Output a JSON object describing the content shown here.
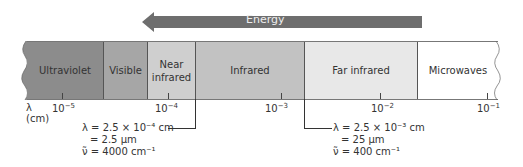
{
  "energy_arrow": {
    "label": "Energy",
    "direction": "left",
    "color": "#6e6e6e"
  },
  "axis": {
    "symbol": "λ",
    "unit": "(cm)",
    "ticks": [
      {
        "base": "10",
        "exp": "−5",
        "x": 62
      },
      {
        "base": "10",
        "exp": "−4",
        "x": 162
      },
      {
        "base": "10",
        "exp": "−3",
        "x": 272
      },
      {
        "base": "10",
        "exp": "−2",
        "x": 381
      },
      {
        "base": "10",
        "exp": "−1",
        "x": 487
      }
    ]
  },
  "regions": [
    {
      "label": "Ultraviolet",
      "color": "#8c8c8c"
    },
    {
      "label": "Visible",
      "color": "#a6a6a6"
    },
    {
      "label": "Near\ninfrared",
      "color": "#cfcfcf"
    },
    {
      "label": "Infrared",
      "color": "#c2c2c2"
    },
    {
      "label": "Far infrared",
      "color": "#e8e8e8"
    },
    {
      "label": "Microwaves",
      "color": "#ffffff"
    }
  ],
  "annotations": {
    "left": {
      "line1": "λ = 2.5 × 10⁻⁴ cm",
      "line2": "= 2.5 μm",
      "line3": "ν̃ = 4000 cm⁻¹"
    },
    "right": {
      "line1": "λ = 2.5 × 10⁻³ cm",
      "line2": "= 25 μm",
      "line3": "ν̃ = 400 cm⁻¹"
    }
  }
}
